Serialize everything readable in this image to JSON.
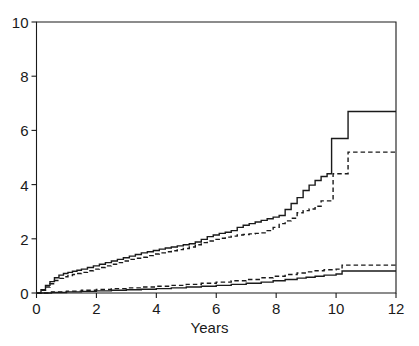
{
  "chart_data": {
    "type": "line",
    "title": "",
    "subtitle": "",
    "xlabel": "Years",
    "ylabel": "",
    "xlim": [
      0,
      12
    ],
    "ylim": [
      0,
      10
    ],
    "xticks": [
      0,
      2,
      4,
      6,
      8,
      10,
      12
    ],
    "yticks": [
      0,
      2,
      4,
      6,
      8,
      10
    ],
    "xtick_labels": [
      "0",
      "2",
      "4",
      "6",
      "8",
      "10",
      "12"
    ],
    "ytick_labels": [
      "0",
      "2",
      "4",
      "6",
      "8",
      "10"
    ],
    "grid": false,
    "legend": "none",
    "step_style": "post",
    "axis_box": "left-bottom-top-right",
    "line_color": "#1a1a1a",
    "background_color": "#ffffff",
    "annotations": [],
    "series": [
      {
        "name": "upper-solid",
        "style": "solid",
        "color": "#1a1a1a",
        "final_value": 6.7,
        "x": [
          0,
          0.15,
          0.3,
          0.45,
          0.6,
          0.75,
          0.9,
          1.05,
          1.2,
          1.35,
          1.5,
          1.7,
          1.9,
          2.1,
          2.3,
          2.5,
          2.7,
          2.9,
          3.1,
          3.3,
          3.5,
          3.7,
          3.9,
          4.1,
          4.3,
          4.5,
          4.7,
          4.9,
          5.1,
          5.3,
          5.5,
          5.7,
          5.9,
          6.1,
          6.3,
          6.5,
          6.7,
          6.9,
          7.1,
          7.3,
          7.5,
          7.7,
          7.9,
          8.1,
          8.3,
          8.5,
          8.7,
          8.9,
          9.1,
          9.3,
          9.5,
          9.7,
          9.85,
          10.4,
          12
        ],
        "y": [
          0.0,
          0.12,
          0.28,
          0.42,
          0.56,
          0.66,
          0.72,
          0.76,
          0.8,
          0.84,
          0.88,
          0.94,
          1.0,
          1.06,
          1.12,
          1.18,
          1.24,
          1.3,
          1.36,
          1.42,
          1.48,
          1.52,
          1.57,
          1.62,
          1.66,
          1.7,
          1.74,
          1.78,
          1.82,
          1.88,
          1.98,
          2.08,
          2.14,
          2.2,
          2.24,
          2.3,
          2.42,
          2.5,
          2.56,
          2.62,
          2.68,
          2.74,
          2.8,
          2.86,
          3.08,
          3.3,
          3.52,
          3.78,
          3.98,
          4.15,
          4.3,
          4.4,
          5.7,
          6.7,
          6.7
        ]
      },
      {
        "name": "upper-dashed",
        "style": "dashed",
        "color": "#1a1a1a",
        "final_value": 5.2,
        "x": [
          0,
          0.15,
          0.3,
          0.45,
          0.6,
          0.75,
          0.9,
          1.05,
          1.2,
          1.35,
          1.5,
          1.7,
          1.9,
          2.1,
          2.3,
          2.5,
          2.7,
          2.9,
          3.1,
          3.3,
          3.5,
          3.7,
          3.9,
          4.1,
          4.3,
          4.5,
          4.7,
          4.9,
          5.1,
          5.3,
          5.5,
          5.7,
          5.9,
          6.1,
          6.3,
          6.5,
          6.7,
          6.9,
          7.1,
          7.3,
          7.5,
          7.7,
          7.9,
          8.1,
          8.3,
          8.5,
          8.7,
          8.9,
          9.1,
          9.3,
          9.5,
          9.9,
          10.4,
          12
        ],
        "y": [
          0.0,
          0.1,
          0.22,
          0.34,
          0.46,
          0.54,
          0.6,
          0.64,
          0.68,
          0.72,
          0.76,
          0.82,
          0.88,
          0.94,
          1.0,
          1.06,
          1.12,
          1.18,
          1.24,
          1.28,
          1.32,
          1.38,
          1.44,
          1.48,
          1.52,
          1.56,
          1.6,
          1.64,
          1.7,
          1.78,
          1.86,
          1.92,
          1.98,
          2.02,
          2.06,
          2.1,
          2.14,
          2.16,
          2.18,
          2.2,
          2.22,
          2.3,
          2.42,
          2.56,
          2.66,
          2.76,
          2.96,
          3.04,
          3.1,
          3.2,
          3.4,
          4.4,
          5.2,
          5.2
        ]
      },
      {
        "name": "lower-dashed",
        "style": "dashed",
        "color": "#1a1a1a",
        "final_value": 1.03,
        "x": [
          0,
          0.5,
          1.0,
          1.5,
          2.0,
          2.5,
          3.0,
          3.5,
          4.0,
          4.5,
          5.0,
          5.5,
          6.0,
          6.5,
          7.0,
          7.5,
          7.9,
          8.3,
          8.7,
          9.0,
          9.3,
          9.6,
          10.0,
          10.2,
          12
        ],
        "y": [
          0.0,
          0.04,
          0.07,
          0.1,
          0.13,
          0.16,
          0.19,
          0.22,
          0.25,
          0.28,
          0.32,
          0.36,
          0.4,
          0.45,
          0.5,
          0.56,
          0.62,
          0.68,
          0.74,
          0.78,
          0.82,
          0.86,
          0.88,
          1.03,
          1.03
        ]
      },
      {
        "name": "lower-solid",
        "style": "solid",
        "color": "#1a1a1a",
        "final_value": 0.81,
        "x": [
          0,
          0.5,
          1.0,
          1.5,
          2.0,
          2.5,
          3.0,
          3.5,
          4.0,
          4.5,
          5.0,
          5.5,
          6.0,
          6.5,
          7.0,
          7.5,
          7.9,
          8.3,
          8.7,
          9.0,
          9.3,
          9.6,
          10.0,
          10.2,
          12
        ],
        "y": [
          0.0,
          0.02,
          0.04,
          0.06,
          0.08,
          0.1,
          0.12,
          0.14,
          0.16,
          0.19,
          0.22,
          0.25,
          0.28,
          0.32,
          0.36,
          0.4,
          0.45,
          0.5,
          0.55,
          0.58,
          0.62,
          0.66,
          0.7,
          0.81,
          0.81
        ]
      }
    ]
  }
}
